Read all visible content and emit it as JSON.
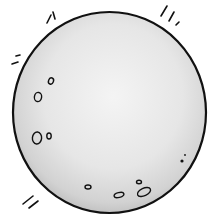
{
  "illustration": {
    "subject": "moon",
    "style": "clip-art line drawing",
    "colors": {
      "background": "#ffffff",
      "outline": "#111111",
      "fill_light": "#f2f2f2",
      "fill_mid": "#dcdcdc",
      "fill_dark": "#b8b8b8"
    },
    "body": {
      "cx": 109.5,
      "cy": 112.5,
      "rx": 96.5,
      "ry": 100.5
    },
    "craters": [
      {
        "cx": 51,
        "cy": 81,
        "rx": 2.5,
        "ry": 3.2,
        "rot": 20
      },
      {
        "cx": 38,
        "cy": 97,
        "rx": 3.6,
        "ry": 4.6,
        "rot": 10
      },
      {
        "cx": 37,
        "cy": 138,
        "rx": 4.6,
        "ry": 6,
        "rot": 5
      },
      {
        "cx": 49,
        "cy": 136,
        "rx": 2.2,
        "ry": 3,
        "rot": 0
      },
      {
        "cx": 88,
        "cy": 187,
        "rx": 3,
        "ry": 2,
        "rot": 0
      },
      {
        "cx": 119,
        "cy": 195,
        "rx": 5,
        "ry": 2.4,
        "rot": -15
      },
      {
        "cx": 139,
        "cy": 182,
        "rx": 2.5,
        "ry": 1.8,
        "rot": 0
      },
      {
        "cx": 144,
        "cy": 192,
        "rx": 7,
        "ry": 3.8,
        "rot": -25
      }
    ],
    "dots": [
      {
        "cx": 182,
        "cy": 161,
        "r": 1.6
      },
      {
        "cx": 185,
        "cy": 155,
        "r": 0.9
      }
    ],
    "motion_marks": [
      {
        "x1": 47,
        "y1": 23,
        "x2": 51,
        "y2": 15
      },
      {
        "x1": 55,
        "y1": 19,
        "x2": 53,
        "y2": 12
      },
      {
        "x1": 12,
        "y1": 64,
        "x2": 18,
        "y2": 62
      },
      {
        "x1": 16,
        "y1": 56,
        "x2": 20,
        "y2": 55
      },
      {
        "x1": 161,
        "y1": 16,
        "x2": 167,
        "y2": 6
      },
      {
        "x1": 169,
        "y1": 21,
        "x2": 174,
        "y2": 12
      },
      {
        "x1": 176,
        "y1": 25,
        "x2": 179,
        "y2": 22
      },
      {
        "x1": 23,
        "y1": 204,
        "x2": 33,
        "y2": 196
      },
      {
        "x1": 29,
        "y1": 208,
        "x2": 38,
        "y2": 201
      }
    ]
  }
}
